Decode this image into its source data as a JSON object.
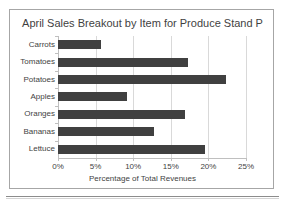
{
  "figure": {
    "title": "April Sales Breakout by Item for Produce Stand P",
    "top_cut_text": ""
  },
  "chart_data": {
    "type": "bar",
    "orientation": "horizontal",
    "title": "April Sales Breakout by Item for Produce Stand P",
    "xlabel": "Percentage of Total Revenues",
    "ylabel": "",
    "categories": [
      "Carrots",
      "Tomatoes",
      "Potatoes",
      "Apples",
      "Oranges",
      "Bananas",
      "Lettuce"
    ],
    "values": [
      5.7,
      17.3,
      22.3,
      9.2,
      16.9,
      12.8,
      19.5
    ],
    "value_unit": "%",
    "xlim": [
      0,
      25
    ],
    "xticks": [
      0,
      5,
      10,
      15,
      20,
      25
    ],
    "xtick_labels": [
      "0%",
      "5%",
      "10%",
      "15%",
      "20%",
      "25%"
    ],
    "grid": "vertical",
    "legend": "none",
    "bar_color": "#404040",
    "gridline_color": "#d9d9d9",
    "text_color": "#3f3f3f",
    "border_color": "#a6a6a6"
  }
}
